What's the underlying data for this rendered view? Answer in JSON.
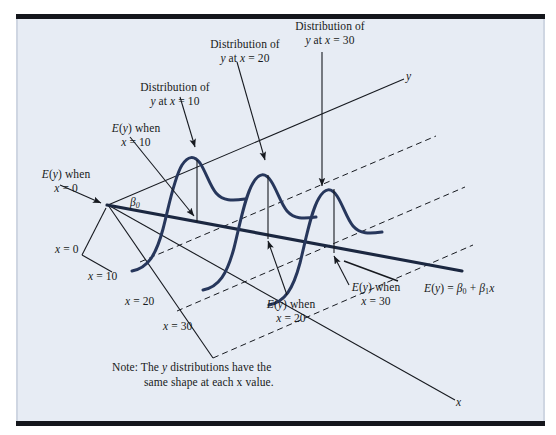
{
  "figure": {
    "type": "statistics-regression-diagram",
    "background_color": "#e7ecf4",
    "curve_color": "#27375c",
    "line_color": "#1b2740",
    "text_color": "#171a20",
    "axis_label_y": "y",
    "axis_label_x": "x",
    "regression_equation": "E(y) = β0 + β1x",
    "intercept_label": "β0",
    "note": "Note:  The y distributions have the same shape at each x value."
  },
  "callouts": {
    "distribution_x10": "Distribution of\ny at x = 10",
    "distribution_x10_line1": "Distribution of",
    "distribution_x10_line2": "y at x = 10",
    "distribution_x20_line1": "Distribution of",
    "distribution_x20_line2": "y at x = 20",
    "distribution_x30_line1": "Distribution of",
    "distribution_x30_line2": "y at x = 30",
    "ey_x0_line1": "E(y) when",
    "ey_x0_line2": "x = 0",
    "ey_x10_line1": "E(y) when",
    "ey_x10_line2": "x = 10",
    "ey_x20_line1": "E(y) when",
    "ey_x20_line2": "x = 20",
    "ey_x30_line1": "E(y) when",
    "ey_x30_line2": "x = 30"
  },
  "axis_ticks": {
    "x0": "x = 0",
    "x10": "x = 10",
    "x20": "x = 20",
    "x30": "x = 30"
  },
  "note_lines": {
    "line1": "Note:  The y distributions have the",
    "line2": "same shape at each x value."
  },
  "chart_data": {
    "type": "line",
    "xlabel": "x",
    "ylabel": "y",
    "x_values": [
      0,
      10,
      20,
      30
    ],
    "series": [
      {
        "name": "E(y) = β0 + β1x",
        "description": "mean regression line"
      },
      {
        "name": "y distribution at x = 10",
        "description": "normal curve centered on E(y)"
      },
      {
        "name": "y distribution at x = 20",
        "description": "normal curve centered on E(y)"
      },
      {
        "name": "y distribution at x = 30",
        "description": "normal curve centered on E(y)"
      }
    ],
    "grid": false,
    "legend": "none",
    "annotations": [
      "Distribution of y at x = 10",
      "Distribution of y at x = 20",
      "Distribution of y at x = 30",
      "E(y) when x = 0",
      "E(y) when x = 10",
      "E(y) when x = 20",
      "E(y) when x = 30",
      "β0",
      "E(y) = β0 + β1x",
      "Note:  The y distributions have the same shape at each x value."
    ]
  }
}
